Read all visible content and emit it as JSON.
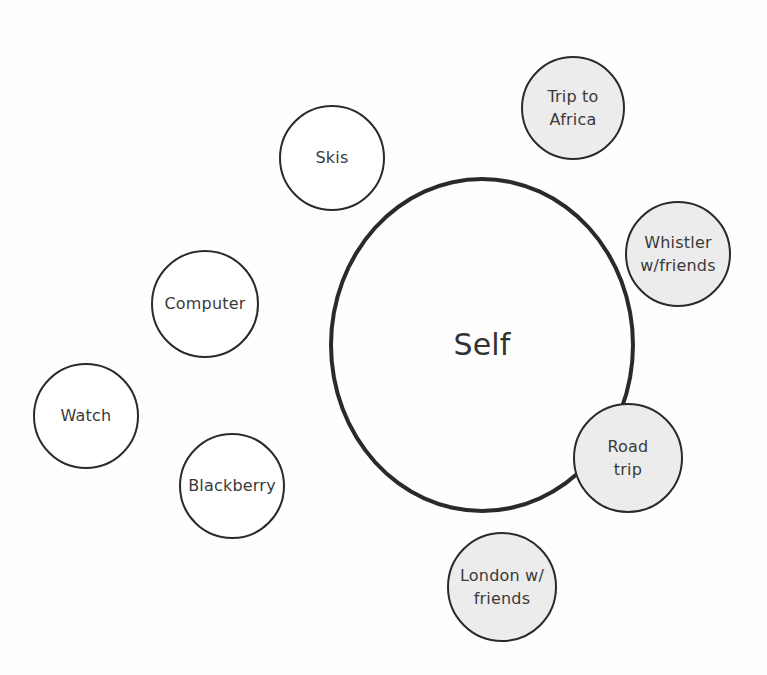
{
  "diagram": {
    "center": {
      "label": "Self",
      "cx": 482,
      "cy": 345,
      "rx": 153,
      "ry": 168
    },
    "things": [
      {
        "label": "Skis",
        "cx": 332,
        "cy": 158,
        "r": 53
      },
      {
        "label": "Computer",
        "cx": 205,
        "cy": 304,
        "r": 54
      },
      {
        "label": "Watch",
        "cx": 86,
        "cy": 416,
        "r": 53
      },
      {
        "label": "Blackberry",
        "cx": 232,
        "cy": 486,
        "r": 53
      }
    ],
    "experiences": [
      {
        "label": "Trip to\nAfrica",
        "cx": 573,
        "cy": 108,
        "r": 52
      },
      {
        "label": "Whistler\nw/friends",
        "cx": 678,
        "cy": 254,
        "r": 53
      },
      {
        "label": "Road\ntrip",
        "cx": 628,
        "cy": 458,
        "r": 55
      },
      {
        "label": "London w/\nfriends",
        "cx": 502,
        "cy": 587,
        "r": 55
      }
    ],
    "colors": {
      "outline": "#2a2a2a",
      "experience_fill": "#ececec",
      "thing_fill": "#ffffff"
    }
  }
}
